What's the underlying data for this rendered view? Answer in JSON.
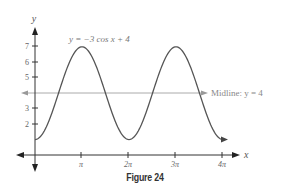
{
  "chart_data": {
    "type": "line",
    "title": "",
    "equation_label": "y = −3 cos x + 4",
    "function": "y = -3*cos(x) + 4",
    "xlabel": "x",
    "ylabel": "y",
    "x_range": [
      0,
      12.566
    ],
    "ylim": [
      0,
      7.5
    ],
    "x_ticks": [
      {
        "value": 3.1416,
        "label": "π"
      },
      {
        "value": 6.2832,
        "label": "2π"
      },
      {
        "value": 9.4248,
        "label": "3π"
      },
      {
        "value": 12.5664,
        "label": "4π"
      }
    ],
    "y_ticks": [
      2,
      3,
      5,
      6,
      7
    ],
    "series": [
      {
        "name": "y = −3 cos x + 4",
        "x": [
          "0",
          "π/2",
          "π",
          "3π/2",
          "2π",
          "5π/2",
          "3π",
          "7π/2",
          "4π"
        ],
        "values": [
          1,
          4,
          7,
          4,
          1,
          4,
          7,
          4,
          1
        ]
      }
    ],
    "annotations": [
      {
        "type": "hline",
        "y": 4,
        "label": "Midline: y = 4"
      }
    ],
    "grid": false,
    "legend": "none"
  },
  "labels": {
    "equation": "y = −3 cos x + 4",
    "midline": "Midline: y = 4",
    "x_axis": "x",
    "y_axis": "y",
    "x_ticks": [
      "π",
      "2π",
      "3π",
      "4π"
    ],
    "y_ticks": [
      "7",
      "6",
      "5",
      "3",
      "2"
    ],
    "caption": "Figure 24"
  },
  "colors": {
    "curve": "#555555",
    "axis": "#333333",
    "midline": "#aaaaaa",
    "text": "#666666"
  }
}
